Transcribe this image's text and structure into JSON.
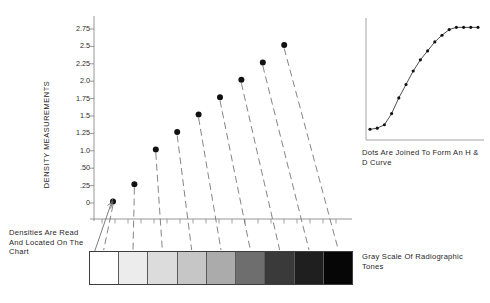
{
  "figure": {
    "y_axis_title": "DENSITY MEASUREMENTS",
    "left_annotation": "Densities Are Read And Located On The Chart",
    "hd_caption": "Dots Are Joined To Form An H & D Curve",
    "grayscale_caption": "Gray Scale Of Radiographic Tones"
  },
  "chart_data": {
    "type": "scatter",
    "title": "",
    "xlabel": "",
    "ylabel": "DENSITY MEASUREMENTS",
    "grid": false,
    "legend": "none",
    "ylim": [
      0,
      3.0
    ],
    "xlim": [
      0,
      10
    ],
    "ytick_labels": [
      "2.75",
      "2.5",
      "2.25",
      "2.0",
      "1.75",
      "1.5",
      "1.25",
      "1.0",
      ".50",
      ".25",
      "0"
    ],
    "ytick_values": [
      2.75,
      2.5,
      2.25,
      2.0,
      1.75,
      1.5,
      1.25,
      1.0,
      0.75,
      0.5,
      0.25
    ],
    "ytick_blank_index": 8,
    "categories": [
      "1",
      "2",
      "3",
      "4",
      "5",
      "6",
      "7",
      "8",
      "9"
    ],
    "values": [
      0.25,
      0.5,
      1.0,
      1.25,
      1.5,
      1.75,
      2.0,
      2.25,
      2.5
    ],
    "point_color": "#111111",
    "leader_line_color": "#6f6f6f",
    "axis_color": "#8a8a8a",
    "n_xticks": 19
  },
  "grayscale": {
    "type": "step-wedge",
    "step_count": 9,
    "steps": [
      {
        "index": 1,
        "density": 0.25,
        "hex": "#ffffff"
      },
      {
        "index": 2,
        "density": 0.5,
        "hex": "#ececec"
      },
      {
        "index": 3,
        "density": 1.0,
        "hex": "#dcdcdc"
      },
      {
        "index": 4,
        "density": 1.25,
        "hex": "#c6c6c6"
      },
      {
        "index": 5,
        "density": 1.5,
        "hex": "#ababab"
      },
      {
        "index": 6,
        "density": 1.75,
        "hex": "#6e6e6e"
      },
      {
        "index": 7,
        "density": 2.0,
        "hex": "#3a3a3a"
      },
      {
        "index": 8,
        "density": 2.25,
        "hex": "#1f1f1f"
      },
      {
        "index": 9,
        "density": 2.5,
        "hex": "#060606"
      }
    ]
  },
  "hd_curve": {
    "type": "line",
    "title": "",
    "xlabel": "",
    "ylabel": "",
    "marker": "dot",
    "grid": false,
    "x": [
      0,
      1,
      2,
      3,
      4,
      5,
      6,
      7,
      8,
      9,
      10,
      11,
      12,
      13,
      14,
      15
    ],
    "y": [
      0.06,
      0.07,
      0.1,
      0.2,
      0.34,
      0.46,
      0.58,
      0.68,
      0.76,
      0.84,
      0.9,
      0.95,
      0.97,
      0.97,
      0.97,
      0.97
    ],
    "line_color": "#3a3a3a",
    "point_color": "#111111",
    "axis_color": "#9a9a9a"
  }
}
